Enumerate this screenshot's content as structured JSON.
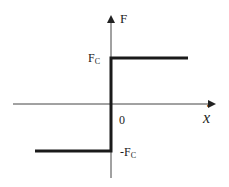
{
  "diagram": {
    "colors": {
      "axis": "#333333",
      "curve": "#1a1a1a",
      "background": "#ffffff"
    },
    "axes": {
      "y_label": "F",
      "x_label": "x",
      "x_label_dot": "·",
      "origin_label": "0"
    },
    "levels": {
      "positive_main": "F",
      "positive_sub": "C",
      "negative_main": "-F",
      "negative_sub": "C"
    }
  }
}
